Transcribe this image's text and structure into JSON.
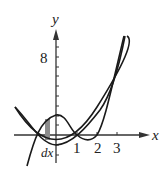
{
  "figure": {
    "axes": {
      "x_label": "x",
      "y_label": "y",
      "x_ticks": [
        "1",
        "2",
        "3"
      ],
      "y_ticks": [
        "8"
      ]
    },
    "annotation": "dx",
    "curves": [
      {
        "name": "cubic",
        "expression": "y = (x+1)(x-1)(x-2)"
      },
      {
        "name": "parabola",
        "expression": "y = x^2 - 1"
      }
    ],
    "colors": {
      "curve": "#1a1a1a",
      "strip": "#8c8c8c"
    }
  }
}
